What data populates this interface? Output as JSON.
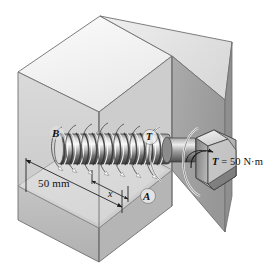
{
  "figure": {
    "type": "engineering-mechanics-diagram",
    "background_color": "#ffffff"
  },
  "labels": {
    "point_b": "B",
    "point_a": "A",
    "torque_mid": "T",
    "dimension_total": "50 mm",
    "dimension_x": "x",
    "torque_symbol": "T",
    "torque_equals": " = 50 N·m"
  },
  "annotations": {
    "torque_value": "50",
    "torque_unit": "N·m",
    "length_value": "50",
    "length_unit": "mm",
    "variable_name": "x"
  },
  "colors": {
    "block_top_light": "#f2f2f2",
    "block_top_shade": "#e2e2e2",
    "block_front_face": "#b9b9b9",
    "block_right_face": "#a3a3a3",
    "block_inner_face": "#cfcfcf",
    "block_cut_floor": "#d8d8d8",
    "outline": "#4d4d4d",
    "metal_light": "#f0f0f0",
    "metal_mid": "#9a9a9a",
    "metal_dark": "#4a4a4a",
    "label_text": "#111111"
  },
  "geometry": {
    "block_description": "Isometric rectangular block with front-top corner cut away",
    "bolt_description": "Threaded bolt shaft with hexagonal head protruding from right face",
    "thread_turns": 13,
    "torque_arrow": "curved arrow around bolt axis indicating applied torque"
  }
}
